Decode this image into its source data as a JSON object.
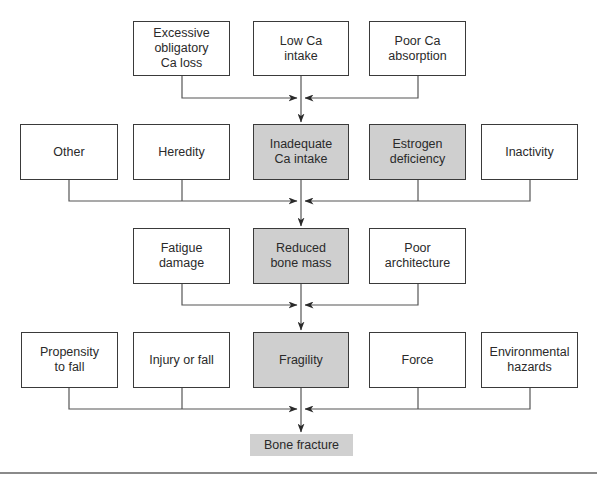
{
  "diagram": {
    "type": "flowchart",
    "title": "",
    "colors": {
      "border": "#3a3a3a",
      "shaded_fill": "#cfcfcf",
      "result_fill": "#d0d0d0",
      "line": "#555555"
    },
    "rows": [
      {
        "name": "row-1",
        "nodes": [
          {
            "id": "excessive-obligatory-ca-loss",
            "label": "Excessive\nobligatory\nCa loss",
            "shaded": false
          },
          {
            "id": "low-ca-intake",
            "label": "Low Ca\nintake",
            "shaded": false
          },
          {
            "id": "poor-ca-absorption",
            "label": "Poor Ca\nabsorption",
            "shaded": false
          }
        ]
      },
      {
        "name": "row-2",
        "nodes": [
          {
            "id": "other",
            "label": "Other",
            "shaded": false
          },
          {
            "id": "heredity",
            "label": "Heredity",
            "shaded": false
          },
          {
            "id": "inadequate-ca-intake",
            "label": "Inadequate\nCa intake",
            "shaded": true
          },
          {
            "id": "estrogen-deficiency",
            "label": "Estrogen\ndeficiency",
            "shaded": true
          },
          {
            "id": "inactivity",
            "label": "Inactivity",
            "shaded": false
          }
        ]
      },
      {
        "name": "row-3",
        "nodes": [
          {
            "id": "fatigue-damage",
            "label": "Fatigue\ndamage",
            "shaded": false
          },
          {
            "id": "reduced-bone-mass",
            "label": "Reduced\nbone mass",
            "shaded": true
          },
          {
            "id": "poor-architecture",
            "label": "Poor\narchitecture",
            "shaded": false
          }
        ]
      },
      {
        "name": "row-4",
        "nodes": [
          {
            "id": "propensity-to-fall",
            "label": "Propensity\nto fall",
            "shaded": false
          },
          {
            "id": "injury-or-fall",
            "label": "Injury or fall",
            "shaded": false
          },
          {
            "id": "fragility",
            "label": "Fragility",
            "shaded": true
          },
          {
            "id": "force",
            "label": "Force",
            "shaded": false
          },
          {
            "id": "environmental-hazards",
            "label": "Environmental\nhazards",
            "shaded": false
          }
        ]
      },
      {
        "name": "row-5",
        "nodes": [
          {
            "id": "bone-fracture",
            "label": "Bone fracture",
            "shaded": true
          }
        ]
      }
    ],
    "edges": [
      {
        "from": "excessive-obligatory-ca-loss",
        "to": "inadequate-ca-intake"
      },
      {
        "from": "low-ca-intake",
        "to": "inadequate-ca-intake"
      },
      {
        "from": "poor-ca-absorption",
        "to": "inadequate-ca-intake"
      },
      {
        "from": "other",
        "to": "reduced-bone-mass"
      },
      {
        "from": "heredity",
        "to": "reduced-bone-mass"
      },
      {
        "from": "inadequate-ca-intake",
        "to": "reduced-bone-mass"
      },
      {
        "from": "estrogen-deficiency",
        "to": "reduced-bone-mass"
      },
      {
        "from": "inactivity",
        "to": "reduced-bone-mass"
      },
      {
        "from": "fatigue-damage",
        "to": "fragility"
      },
      {
        "from": "reduced-bone-mass",
        "to": "fragility"
      },
      {
        "from": "poor-architecture",
        "to": "fragility"
      },
      {
        "from": "propensity-to-fall",
        "to": "bone-fracture"
      },
      {
        "from": "injury-or-fall",
        "to": "bone-fracture"
      },
      {
        "from": "fragility",
        "to": "bone-fracture"
      },
      {
        "from": "force",
        "to": "bone-fracture"
      },
      {
        "from": "environmental-hazards",
        "to": "bone-fracture"
      }
    ]
  }
}
